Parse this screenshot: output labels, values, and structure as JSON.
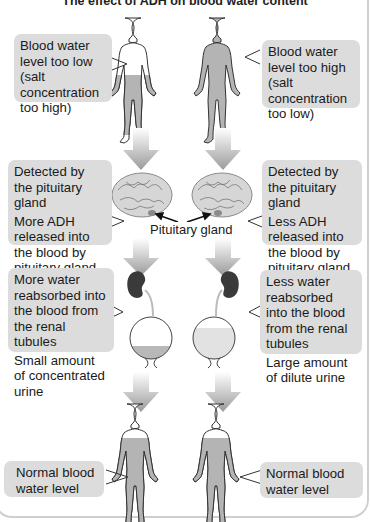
{
  "title": "The effect of ADH on blood water content",
  "left_column": {
    "stage1": {
      "lines": [
        "Blood water level too low (salt concentration too high)"
      ],
      "figure_fill": "lower-half"
    },
    "stage2": {
      "lines": [
        "Detected by the pituitary gland",
        "More ADH released into the blood by pituitary gland"
      ]
    },
    "stage3": {
      "lines": [
        "More water reabsorbed into the blood from the renal tubules",
        "Small amount of concentrated urine"
      ],
      "bladder_level": "low"
    },
    "stage4": {
      "lines": [
        "Normal blood water level"
      ],
      "figure_fill": "normal"
    }
  },
  "right_column": {
    "stage1": {
      "lines": [
        "Blood water level too high (salt concentration too low)"
      ],
      "figure_fill": "full"
    },
    "stage2": {
      "lines": [
        "Detected by the pituitary gland",
        "Less ADH released into the blood by pituitary gland"
      ]
    },
    "stage3": {
      "lines": [
        "Less water reabsorbed into the blood from the renal tubules",
        "Large amount of dilute urine"
      ],
      "bladder_level": "high"
    },
    "stage4": {
      "lines": [
        "Normal blood water level"
      ],
      "figure_fill": "normal"
    }
  },
  "center_label": "Pituitary gland",
  "colors": {
    "box_bg": "#dcdcdc",
    "body_fill": "#b4b4b4",
    "kidney": "#3a3a3a",
    "arrow_top": "#ffffff",
    "arrow_bottom": "#9a9a9a",
    "concentrated_urine": "#b8b8b8",
    "dilute_urine": "#e2e2e2"
  }
}
